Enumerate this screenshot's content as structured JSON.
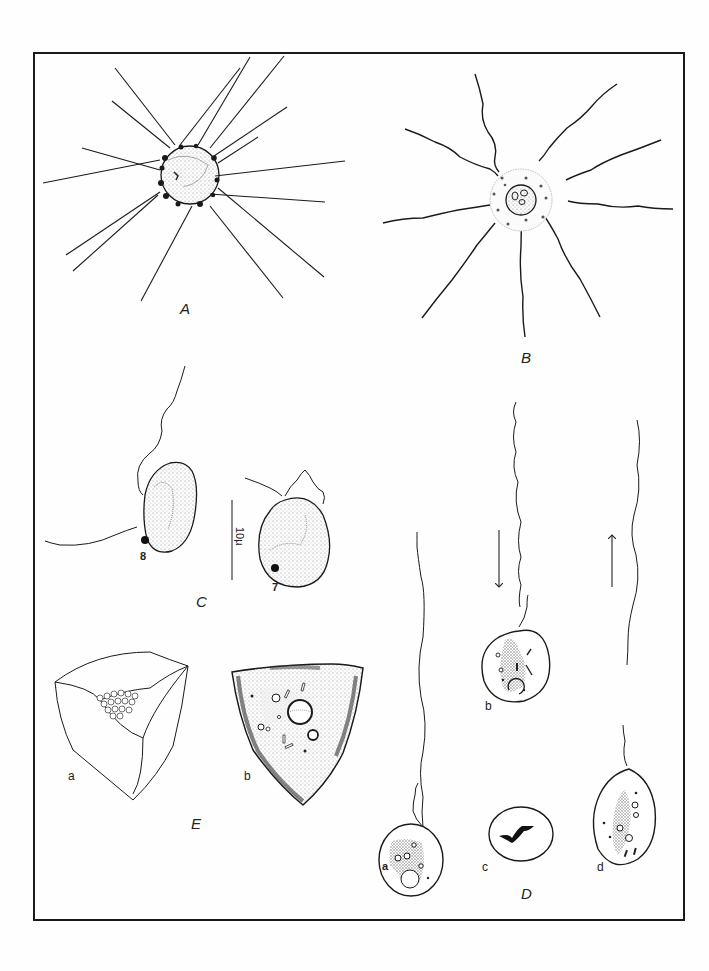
{
  "figure": {
    "panels": [
      {
        "id": "A",
        "label": "A",
        "description": "Heliozoan-like cell with straight radiating axopodia"
      },
      {
        "id": "B",
        "label": "B",
        "description": "Central cell with vacuolated cortex and wavy radiating flagella"
      },
      {
        "id": "C",
        "label": "C",
        "description": "Two flagellate cells with dark eyespot",
        "cells": [
          "8",
          "7"
        ],
        "scale_bar": "10µ"
      },
      {
        "id": "D",
        "label": "D",
        "description": "Uniflagellate ovoid cells; arrows indicate swimming direction",
        "subfigures": [
          "a",
          "b",
          "c",
          "d"
        ],
        "arrows": [
          "down",
          "up"
        ]
      },
      {
        "id": "E",
        "label": "E",
        "description": "Tetrahedral cyst: a external view, b optical section",
        "subfigures": [
          "a",
          "b"
        ]
      }
    ]
  },
  "labels": {
    "A": "A",
    "B": "B",
    "C": "C",
    "D": "D",
    "E": "E",
    "c_cell_8": "8",
    "c_cell_7": "7",
    "c_scale": "10µ",
    "d_a": "a",
    "d_b": "b",
    "d_c": "c",
    "d_d": "d",
    "e_a": "a",
    "e_b": "b"
  },
  "colors": {
    "ink": "#1a1a1a",
    "stipple": "#9a9a9a",
    "paper": "#fefefe"
  }
}
